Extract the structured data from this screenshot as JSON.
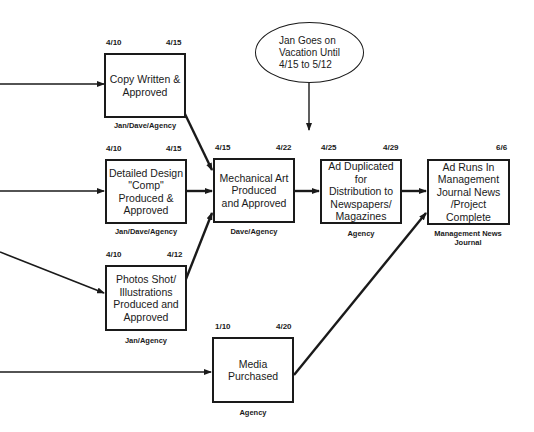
{
  "diagram": {
    "type": "PERT / network schedule",
    "note": {
      "text": "Jan Goes on\nVacation Until\n4/15 to 5/12"
    },
    "tasks": [
      {
        "id": "copy",
        "label": "Copy Written &\nApproved",
        "start": "4/10",
        "end": "4/15",
        "owner": "Jan/Dave/Agency"
      },
      {
        "id": "design",
        "label": "Detailed Design\n\"Comp\"\nProduced &\nApproved",
        "start": "4/10",
        "end": "4/15",
        "owner": "Jan/Dave/Agency"
      },
      {
        "id": "photos",
        "label": "Photos Shot/\nIllustrations\nProduced and\nApproved",
        "start": "4/10",
        "end": "4/12",
        "owner": "Jan/Agency"
      },
      {
        "id": "mechanical",
        "label": "Mechanical Art\nProduced\nand Approved",
        "start": "4/15",
        "end": "4/22",
        "owner": "Dave/Agency"
      },
      {
        "id": "duplicated",
        "label": "Ad Duplicated for\nDistribution to\nNewspapers/\nMagazines",
        "start": "4/25",
        "end": "4/29",
        "owner": "Agency"
      },
      {
        "id": "runs",
        "label": "Ad Runs In\nManagement\nJournal News\n/Project\nComplete",
        "start": "",
        "end": "6/6",
        "owner": "Management News\nJournal"
      },
      {
        "id": "media",
        "label": "Media\nPurchased",
        "start": "1/10",
        "end": "4/20",
        "owner": "Agency"
      }
    ],
    "edges": [
      {
        "from": "(offscreen)",
        "to": "copy"
      },
      {
        "from": "(offscreen)",
        "to": "design"
      },
      {
        "from": "(offscreen)",
        "to": "photos"
      },
      {
        "from": "(offscreen)",
        "to": "media"
      },
      {
        "from": "copy",
        "to": "mechanical"
      },
      {
        "from": "design",
        "to": "mechanical"
      },
      {
        "from": "photos",
        "to": "mechanical"
      },
      {
        "from": "note",
        "to": "duplicated"
      },
      {
        "from": "mechanical",
        "to": "duplicated"
      },
      {
        "from": "duplicated",
        "to": "runs"
      },
      {
        "from": "media",
        "to": "runs"
      }
    ],
    "colors": {
      "line": "#1a1a1a",
      "background": "#ffffff"
    }
  }
}
